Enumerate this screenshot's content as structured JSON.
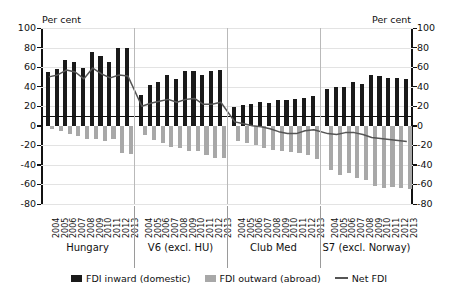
{
  "axis": {
    "unit_left": "Per cent",
    "unit_right": "Per cent",
    "ticks": [
      "100",
      "80",
      "60",
      "40",
      "20",
      "0",
      "-20",
      "-40",
      "-60",
      "-80"
    ]
  },
  "legend": {
    "items": [
      {
        "label": "FDI inward (domestic)",
        "type": "bar",
        "color": "#1a1a1a"
      },
      {
        "label": "FDI outward (abroad)",
        "type": "bar",
        "color": "#a8a8a8"
      },
      {
        "label": "Net FDI",
        "type": "line",
        "color": "#555555"
      }
    ]
  },
  "chart_data": {
    "type": "bar",
    "title": "",
    "xlabel": "",
    "ylabel": "Per cent",
    "ylim": [
      -80,
      100
    ],
    "yticks": [
      100,
      80,
      60,
      40,
      20,
      0,
      -20,
      -40,
      -60,
      -80
    ],
    "grid": true,
    "legend_position": "bottom",
    "categories": [
      "2004",
      "2005",
      "2006",
      "2007",
      "2008",
      "2009",
      "2010",
      "2011",
      "2012",
      "2013",
      "2004",
      "2005",
      "2006",
      "2007",
      "2008",
      "2009",
      "2010",
      "2011",
      "2012",
      "2013",
      "2004",
      "2005",
      "2006",
      "2007",
      "2008",
      "2009",
      "2010",
      "2011",
      "2012",
      "2013",
      "2004",
      "2005",
      "2006",
      "2007",
      "2008",
      "2009",
      "2010",
      "2011",
      "2012",
      "2013"
    ],
    "groups": [
      {
        "name": "Hungary",
        "years": [
          "2004",
          "2005",
          "2006",
          "2007",
          "2008",
          "2009",
          "2010",
          "2011",
          "2012",
          "2013"
        ]
      },
      {
        "name": "V6 (excl. HU)",
        "years": [
          "2004",
          "2005",
          "2006",
          "2007",
          "2008",
          "2009",
          "2010",
          "2011",
          "2012",
          "2013"
        ]
      },
      {
        "name": "Club Med",
        "years": [
          "2004",
          "2005",
          "2006",
          "2007",
          "2008",
          "2009",
          "2010",
          "2011",
          "2012",
          "2013"
        ]
      },
      {
        "name": "S7 (excl. Norway)",
        "years": [
          "2004",
          "2005",
          "2006",
          "2007",
          "2008",
          "2009",
          "2010",
          "2011",
          "2012",
          "2013"
        ]
      }
    ],
    "series": [
      {
        "name": "FDI inward (domestic)",
        "color": "#1a1a1a",
        "values": [
          55,
          58,
          67,
          65,
          59,
          75,
          71,
          65,
          80,
          80,
          31,
          42,
          45,
          52,
          48,
          56,
          56,
          52,
          56,
          57,
          19,
          21,
          22,
          24,
          23,
          26,
          26,
          27,
          28,
          30,
          38,
          40,
          40,
          45,
          43,
          52,
          51,
          49,
          49,
          48
        ]
      },
      {
        "name": "FDI outward (abroad)",
        "color": "#a8a8a8",
        "values": [
          -3,
          -5,
          -8,
          -10,
          -14,
          -14,
          -16,
          -14,
          -28,
          -29,
          -9,
          -15,
          -18,
          -22,
          -23,
          -26,
          -26,
          -30,
          -33,
          -33,
          -16,
          -18,
          -20,
          -23,
          -25,
          -26,
          -27,
          -28,
          -30,
          -34,
          -45,
          -50,
          -48,
          -53,
          -55,
          -62,
          -64,
          -63,
          -64,
          -65
        ]
      },
      {
        "name": "Net FDI",
        "color": "#555555",
        "values": [
          50,
          52,
          57,
          55,
          48,
          59,
          53,
          49,
          52,
          51,
          20,
          23,
          25,
          27,
          24,
          27,
          28,
          22,
          22,
          24,
          4,
          2,
          0,
          -1,
          -3,
          -6,
          -8,
          -8,
          -5,
          -4,
          -8,
          -9,
          -7,
          -7,
          -9,
          -12,
          -13,
          -14,
          -15,
          -16
        ]
      }
    ]
  }
}
